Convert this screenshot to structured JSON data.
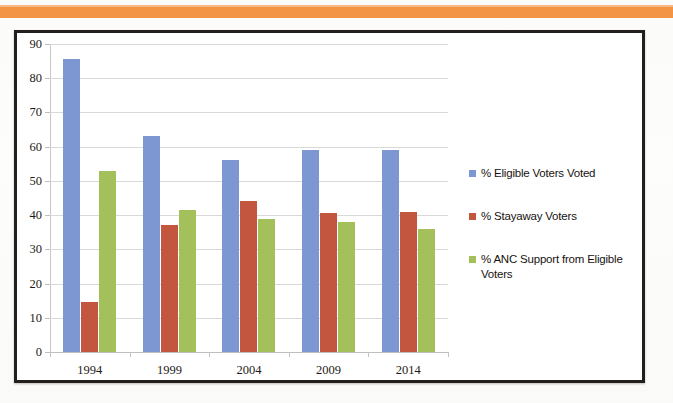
{
  "page": {
    "banner_color": "#f39445",
    "background_color": "#fdfdfc",
    "frame_color": "#231f1c"
  },
  "chart_data": {
    "type": "bar",
    "title": "",
    "subtitle": "",
    "xlabel": "",
    "ylabel": "",
    "categories": [
      "1994",
      "1999",
      "2004",
      "2009",
      "2014"
    ],
    "series": [
      {
        "name": "% Eligible Voters Voted",
        "color": "#7d97d3",
        "values": [
          85.5,
          63,
          56,
          59,
          59
        ]
      },
      {
        "name": "% Stayaway Voters",
        "color": "#c2563f",
        "values": [
          14.5,
          37,
          44,
          40.5,
          41
        ]
      },
      {
        "name": "% ANC Support from Eligible Voters",
        "color": "#a4c05a",
        "values": [
          53,
          41.5,
          39,
          38,
          36
        ]
      }
    ],
    "ylim": [
      0,
      90
    ],
    "yticks": [
      0,
      10,
      20,
      30,
      40,
      50,
      60,
      70,
      80,
      90
    ],
    "ytick_labels": [
      "0",
      "10",
      "20",
      "30",
      "40",
      "50",
      "60",
      "70",
      "80",
      "90"
    ],
    "grid": true,
    "legend_position": "right",
    "legend_entries": [
      "% Eligible Voters Voted",
      "% Stayaway Voters",
      "% ANC Support from Eligible Voters"
    ]
  }
}
